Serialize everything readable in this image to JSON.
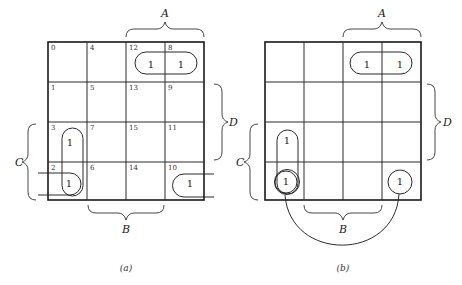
{
  "diagram": {
    "type": "karnaugh-map-4var",
    "cell_size": 39,
    "maps": [
      {
        "id": "a",
        "caption": "(a)",
        "origin": [
          48,
          42
        ],
        "show_indices": true,
        "cell_indices": [
          [
            "0",
            "4",
            "12",
            "8"
          ],
          [
            "1",
            "5",
            "13",
            "9"
          ],
          [
            "3",
            "7",
            "15",
            "11"
          ],
          [
            "2",
            "6",
            "14",
            "10"
          ]
        ],
        "ones": [
          {
            "row": 0,
            "col": 2,
            "text": "1"
          },
          {
            "row": 0,
            "col": 3,
            "text": "1"
          },
          {
            "row": 2,
            "col": 0,
            "text": "1"
          },
          {
            "row": 3,
            "col": 0,
            "text": "1"
          },
          {
            "row": 3,
            "col": 3,
            "text": "1"
          }
        ],
        "labels": {
          "A": "A",
          "B": "B",
          "C": "C",
          "D": "D"
        }
      },
      {
        "id": "b",
        "caption": "(b)",
        "origin": [
          265,
          42
        ],
        "show_indices": false,
        "cell_indices": [
          [
            "",
            "",
            "",
            ""
          ],
          [
            "",
            "",
            "",
            ""
          ],
          [
            "",
            "",
            "",
            ""
          ],
          [
            "",
            "",
            "",
            ""
          ]
        ],
        "ones": [
          {
            "row": 0,
            "col": 2,
            "text": "1"
          },
          {
            "row": 0,
            "col": 3,
            "text": "1"
          },
          {
            "row": 2,
            "col": 0,
            "text": "1"
          },
          {
            "row": 3,
            "col": 0,
            "text": "1"
          },
          {
            "row": 3,
            "col": 3,
            "text": "1"
          }
        ],
        "labels": {
          "A": "A",
          "B": "B",
          "C": "C",
          "D": "D"
        }
      }
    ],
    "groupings": {
      "a": [
        "pill over cells 12-8",
        "vertical pill over cells 3-2",
        "wrap-around loop cells 2 and 10 (horizontal edges)"
      ],
      "b": [
        "pill over top-right pair",
        "vertical pill over left column rows 3-4",
        "circles on corner cells joined by arc below map"
      ]
    }
  }
}
